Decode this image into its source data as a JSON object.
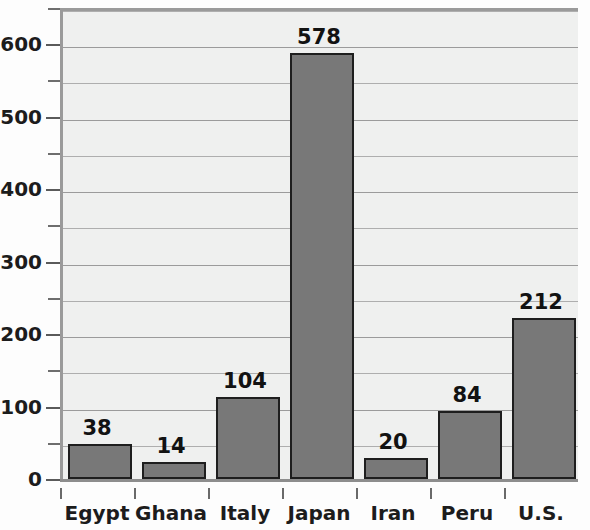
{
  "chart_data": {
    "type": "bar",
    "title": "",
    "subtitle": "",
    "xlabel": "",
    "ylabel": "",
    "categories": [
      "Egypt",
      "Ghana",
      "Italy",
      "Japan",
      "Iran",
      "Peru",
      "U.S."
    ],
    "values": [
      38,
      14,
      104,
      578,
      20,
      84,
      212
    ],
    "value_labels": [
      "38",
      "14",
      "104",
      "578",
      "20",
      "84",
      "212"
    ],
    "ylim": [
      0,
      650
    ],
    "y_major_ticks": [
      0,
      100,
      200,
      300,
      400,
      500,
      600
    ],
    "y_major_tick_labels": [
      "0",
      "100",
      "200",
      "300",
      "400",
      "500",
      "600"
    ],
    "y_minor_ticks": [
      50,
      150,
      250,
      350,
      450,
      550,
      650
    ],
    "grid": true,
    "grid_axis": "y",
    "legend": false,
    "legend_position": "none",
    "bar_fill_color": "#787878",
    "bar_border_color": "#1e1e1e",
    "plot_background_color": "#eff0ef",
    "gridline_color": "#9b9b9b",
    "axis_color": "#9a9a9a",
    "text_color": "#1c1c1c"
  }
}
